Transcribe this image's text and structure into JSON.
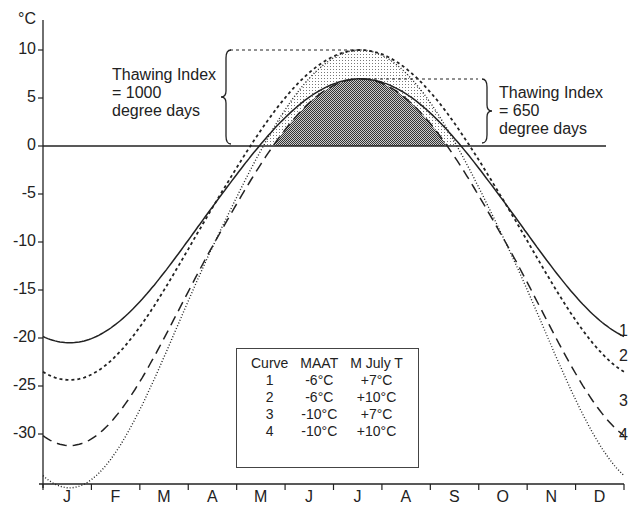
{
  "chart_data": {
    "type": "line",
    "title": "",
    "ylabel": "°C",
    "xlabel": "",
    "ylim": [
      -35,
      12
    ],
    "yticks": [
      10,
      5,
      0,
      -5,
      -10,
      -15,
      -20,
      -25,
      -30
    ],
    "categories": [
      "J",
      "F",
      "M",
      "A",
      "M",
      "J",
      "J",
      "A",
      "S",
      "O",
      "N",
      "D"
    ],
    "series": [
      {
        "name": "1",
        "style": "solid",
        "maat": "-6°C",
        "july": "+7°C",
        "values": [
          -19.2,
          -18.0,
          -14.5,
          -8.0,
          -1.0,
          5.0,
          7.0,
          5.0,
          -1.0,
          -8.0,
          -14.5,
          -18.5
        ]
      },
      {
        "name": "2",
        "style": "short-dash",
        "maat": "-6°C",
        "july": "+10°C",
        "values": [
          -22.0,
          -20.5,
          -16.5,
          -9.0,
          0.0,
          7.5,
          10.0,
          7.5,
          0.0,
          -9.0,
          -16.5,
          -21.0
        ]
      },
      {
        "name": "3",
        "style": "long-dash",
        "maat": "-10°C",
        "july": "+7°C",
        "values": [
          -26.8,
          -25.0,
          -19.0,
          -9.5,
          -1.0,
          5.0,
          7.0,
          5.0,
          -1.0,
          -10.0,
          -19.5,
          -25.5
        ]
      },
      {
        "name": "4",
        "style": "dotted",
        "maat": "-10°C",
        "july": "+10°C",
        "values": [
          -30.2,
          -28.0,
          -21.0,
          -10.0,
          0.0,
          7.5,
          10.0,
          7.5,
          0.0,
          -10.5,
          -21.0,
          -28.5
        ]
      }
    ],
    "annotations": [
      {
        "text": "Thawing Index = 1000 degree days",
        "refers_to": "curve peak +10°C, stippled area"
      },
      {
        "text": "Thawing Index = 650 degree days",
        "refers_to": "curve peak +7°C, dark shaded area"
      }
    ],
    "grid": false,
    "legend_position": "bottom-center table"
  },
  "axis": {
    "unit": "°C",
    "y_labels": [
      "10",
      "5",
      "0",
      "-5",
      "-10",
      "-15",
      "-20",
      "-25",
      "-30"
    ],
    "months": [
      "J",
      "F",
      "M",
      "A",
      "M",
      "J",
      "J",
      "A",
      "S",
      "O",
      "N",
      "D"
    ]
  },
  "annotations": {
    "left": {
      "line1": "Thawing Index",
      "line2": "= 1000",
      "line3": "degree days"
    },
    "right": {
      "line1": "Thawing Index",
      "line2": "= 650",
      "line3": "degree days"
    }
  },
  "legend": {
    "headers": [
      "Curve",
      "MAAT",
      "M July T"
    ],
    "rows": [
      [
        "1",
        "-6°C",
        "+7°C"
      ],
      [
        "2",
        "-6°C",
        "+10°C"
      ],
      [
        "3",
        "-10°C",
        "+7°C"
      ],
      [
        "4",
        "-10°C",
        "+10°C"
      ]
    ]
  },
  "curve_labels": [
    "1",
    "2",
    "3",
    "4"
  ]
}
